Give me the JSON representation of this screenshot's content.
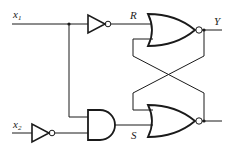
{
  "diagram": {
    "type": "logic-circuit",
    "inputs": [
      {
        "name": "x",
        "subscript": "1"
      },
      {
        "name": "x",
        "subscript": "2"
      }
    ],
    "signals": {
      "R": "R",
      "S": "S"
    },
    "outputs": [
      {
        "name": "Y"
      }
    ],
    "gates": [
      {
        "id": "inv1",
        "type": "NOT",
        "input": "x1",
        "output": "R"
      },
      {
        "id": "inv2",
        "type": "NOT",
        "input": "x2"
      },
      {
        "id": "and1",
        "type": "AND",
        "inputs": [
          "x1",
          "NOT x2"
        ],
        "output": "S"
      },
      {
        "id": "nor1",
        "type": "NOR",
        "inputs": [
          "R",
          "nor2.out"
        ],
        "output": "Y"
      },
      {
        "id": "nor2",
        "type": "NOR",
        "inputs": [
          "nor1.out",
          "S"
        ]
      }
    ],
    "colors": {
      "stroke": "#1a1a1a",
      "background": "#ffffff"
    }
  }
}
